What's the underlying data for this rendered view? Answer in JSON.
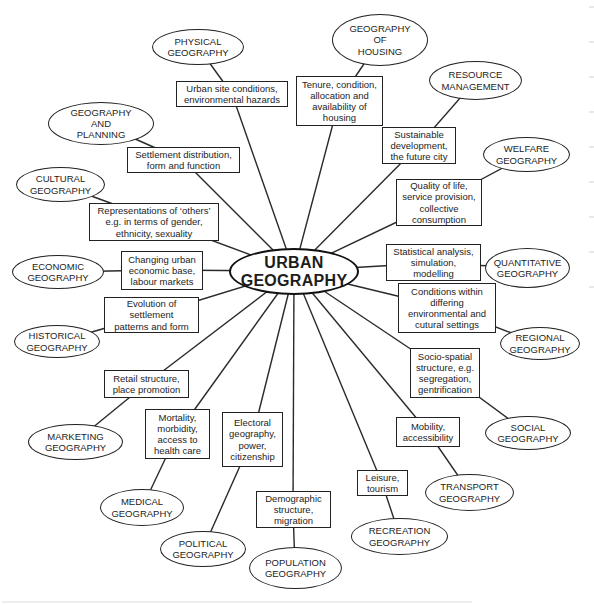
{
  "figure": {
    "background": "#ffffff",
    "ink_color": "#222222",
    "type": "concept-map"
  },
  "center": {
    "label": "URBAN\nGEOGRAPHY"
  },
  "spokes": [
    {
      "discipline": "PHYSICAL\nGEOGRAPHY",
      "topic": "Urban site conditions,\nenvironmental hazards"
    },
    {
      "discipline": "GEOGRAPHY\nOF\nHOUSING",
      "topic": "Tenure, condition,\nallocation and\navailability of\nhousing"
    },
    {
      "discipline": "RESOURCE\nMANAGEMENT",
      "topic": "Sustainable\ndevelopment,\nthe future city"
    },
    {
      "discipline": "GEOGRAPHY\nAND\nPLANNING",
      "topic": "Settlement distribution,\nform and function"
    },
    {
      "discipline": "WELFARE\nGEOGRAPHY",
      "topic": "Quality of life,\nservice provision,\ncollective\nconsumption"
    },
    {
      "discipline": "CULTURAL\nGEOGRAPHY",
      "topic": "Representations of ‘others’\ne.g. in terms of gender,\nethnicity, sexuality"
    },
    {
      "discipline": "QUANTITATIVE\nGEOGRAPHY",
      "topic": "Statistical analysis,\nsimulation,\nmodelling"
    },
    {
      "discipline": "ECONOMIC\nGEOGRAPHY",
      "topic": "Changing urban\neconomic base,\nlabour markets"
    },
    {
      "discipline": "REGIONAL\nGEOGRAPHY",
      "topic": "Conditions within\ndiffering\nenvironmental and\ncutural settings"
    },
    {
      "discipline": "HISTORICAL\nGEOGRAPHY",
      "topic": "Evolution of\nsettlement\npatterns and form"
    },
    {
      "discipline": "SOCIAL\nGEOGRAPHY",
      "topic": "Socio-spatial\nstructure, e.g.\nsegregation,\ngentrification"
    },
    {
      "discipline": "MARKETING\nGEOGRAPHY",
      "topic": "Retail structure,\nplace promotion"
    },
    {
      "discipline": "MEDICAL\nGEOGRAPHY",
      "topic": "Mortality,\nmorbidity,\naccess to\nhealth care"
    },
    {
      "discipline": "POLITICAL\nGEOGRAPHY",
      "topic": "Electoral\ngeography,\npower,\ncitizenship"
    },
    {
      "discipline": "TRANSPORT\nGEOGRAPHY",
      "topic": "Mobility,\naccessibility"
    },
    {
      "discipline": "RECREATION\nGEOGRAPHY",
      "topic": "Leisure,\ntourism"
    },
    {
      "discipline": "POPULATION\nGEOGRAPHY",
      "topic": "Demographic\nstructure,\nmigration"
    }
  ]
}
